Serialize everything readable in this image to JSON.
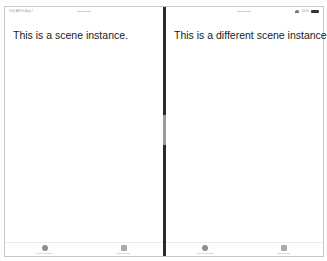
{
  "status_bar": {
    "time": "9:41 AM  Fri Aug 7",
    "battery_percent": "100%"
  },
  "scenes": [
    {
      "text": "This is a scene instance.",
      "tabs": [
        {
          "label": "Scene Storage",
          "icon": "circle-icon"
        },
        {
          "label": "Tab Storage",
          "icon": "square-icon"
        }
      ]
    },
    {
      "text": "This is a different scene instance.",
      "tabs": [
        {
          "label": "Scene Storage",
          "icon": "circle-icon"
        },
        {
          "label": "Tab Storage",
          "icon": "square-icon"
        }
      ]
    }
  ]
}
